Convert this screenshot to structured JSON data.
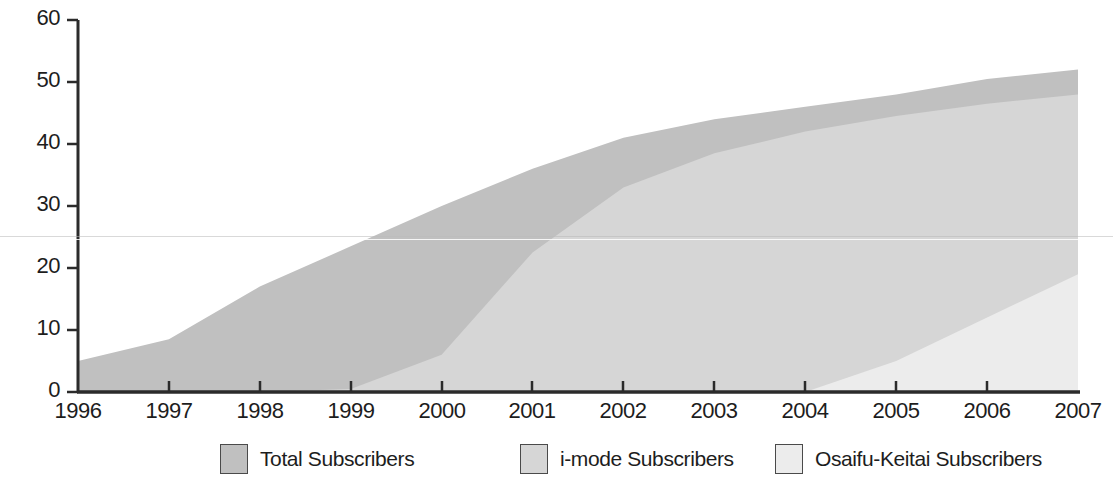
{
  "chart_data": {
    "type": "area",
    "title": "",
    "subtitle": "",
    "xlabel": "",
    "ylabel": "(million)",
    "stacked": false,
    "grid": false,
    "legend_position": "bottom",
    "x": [
      1996,
      1997,
      1998,
      1999,
      2000,
      2001,
      2002,
      2003,
      2004,
      2005,
      2006,
      2007
    ],
    "xlim": [
      1996,
      2007
    ],
    "ylim": [
      0,
      60
    ],
    "xticks": [
      "1996",
      "1997",
      "1998",
      "1999",
      "2000",
      "2001",
      "2002",
      "2003",
      "2004",
      "2005",
      "2006",
      "2007"
    ],
    "yticks": [
      "0",
      "10",
      "20",
      "30",
      "40",
      "50",
      "60"
    ],
    "series": [
      {
        "name": "Total Subscribers",
        "color": "#c0c0c0",
        "values": [
          5.0,
          8.5,
          17.0,
          23.5,
          30.0,
          36.0,
          41.0,
          44.0,
          46.0,
          48.0,
          50.5,
          52.0
        ]
      },
      {
        "name": "i-mode Subscribers",
        "color": "#d6d6d6",
        "values": [
          0,
          0,
          0,
          0.5,
          6.0,
          22.5,
          33.0,
          38.5,
          42.0,
          44.5,
          46.5,
          48.0
        ]
      },
      {
        "name": "Osaifu-Keitai Subscribers",
        "color": "#ececec",
        "values": [
          0,
          0,
          0,
          0,
          0,
          0,
          0,
          0,
          0,
          5.0,
          12.0,
          19.0
        ]
      }
    ],
    "legend": [
      {
        "label": "Total Subscribers",
        "color": "#c0c0c0"
      },
      {
        "label": "i-mode Subscribers",
        "color": "#d6d6d6"
      },
      {
        "label": "Osaifu-Keitai Subscribers",
        "color": "#ececec"
      }
    ],
    "axis_color": "#2b2b2b",
    "text_color": "#1d1d1d"
  },
  "legend_positions": [
    220,
    520,
    775
  ],
  "ytick_positions": [
    392,
    330,
    268,
    206,
    144,
    82,
    20
  ],
  "xtick_positions": [
    78,
    169,
    260,
    351,
    442,
    532,
    623,
    714,
    805,
    896,
    987,
    1078
  ]
}
